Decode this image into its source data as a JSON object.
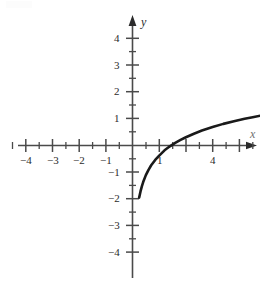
{
  "figure": {
    "title": "",
    "axis_labels": {
      "x": "x",
      "y": "y"
    }
  },
  "chart_data": {
    "type": "line",
    "title": "",
    "subtitle": "",
    "xlabel": "x",
    "ylabel": "y",
    "xlim": [
      -4.9,
      4.8
    ],
    "ylim": [
      -4.5,
      4.6
    ],
    "grid": false,
    "legend": false,
    "legend_position": "none",
    "x_ticks_major": [
      -4,
      -3,
      -2,
      -1,
      1,
      2,
      3,
      4
    ],
    "x_ticks_minor": [
      -4.5,
      -3.5,
      -2.5,
      -1.5,
      -0.5,
      0.5,
      1.5,
      2.5,
      3.5,
      4.5
    ],
    "x_tick_labels": [
      "−4",
      "−3",
      "−2",
      "−1",
      "1",
      "4"
    ],
    "x_tick_labels_shown": [
      {
        "value": -4,
        "text": "−4"
      },
      {
        "value": -3,
        "text": "−3"
      },
      {
        "value": -2,
        "text": "−2"
      },
      {
        "value": -1,
        "text": "−1"
      },
      {
        "value": 1,
        "text": "1"
      },
      {
        "value": 4,
        "text": "4"
      }
    ],
    "y_ticks_major": [
      -4,
      -3,
      -2,
      -1,
      1,
      2,
      3,
      4
    ],
    "y_ticks_minor": [
      -3.5,
      -2.5,
      -1.5,
      -0.5,
      0.5,
      1.5,
      2.5,
      3.5
    ],
    "y_tick_labels_shown": [
      {
        "value": 4,
        "text": "4"
      },
      {
        "value": 3,
        "text": "3"
      },
      {
        "value": 2,
        "text": "2"
      },
      {
        "value": 1,
        "text": "1"
      },
      {
        "value": -1,
        "text": "−1"
      },
      {
        "value": -2,
        "text": "−2"
      },
      {
        "value": -3,
        "text": "−3"
      },
      {
        "value": -4,
        "text": "−4"
      }
    ],
    "series": [
      {
        "name": "logarithmic curve",
        "color": "#1a1a1a",
        "x": [
          0.25,
          0.3,
          0.35,
          0.4,
          0.5,
          0.6,
          0.7,
          0.85,
          1.0,
          1.2,
          1.4,
          1.6,
          1.8,
          2.0,
          2.3,
          2.6,
          3.0,
          3.4,
          3.8,
          4.2,
          4.5,
          4.8
        ],
        "y": [
          -1.95,
          -1.72,
          -1.53,
          -1.37,
          -1.11,
          -0.91,
          -0.74,
          -0.54,
          -0.38,
          -0.18,
          -0.03,
          0.1,
          0.21,
          0.31,
          0.44,
          0.56,
          0.69,
          0.81,
          0.91,
          1.0,
          1.06,
          1.12
        ],
        "x_intercept": 1.45,
        "endpoint_left": [
          0.25,
          -1.95
        ],
        "endpoint_right": [
          4.8,
          1.12
        ]
      }
    ],
    "axes_style": {
      "arrows": [
        "x-positive",
        "y-positive"
      ],
      "origin_label": "",
      "line_color": "#4a4a4a",
      "curve_color": "#1a1a1a"
    }
  }
}
